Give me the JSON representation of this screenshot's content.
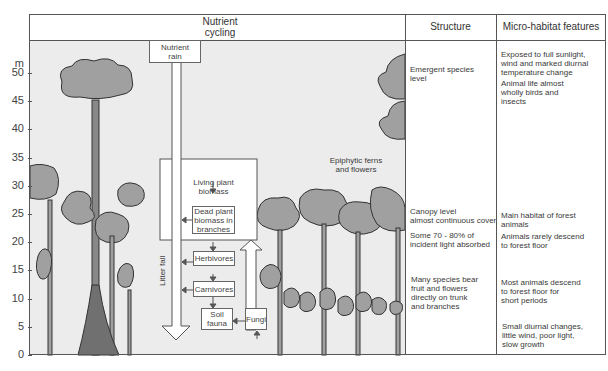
{
  "header": {
    "nutrient_cycling": "Nutrient\ncycling",
    "nutrient_cycling_line1": "Nutrient",
    "nutrient_cycling_line2": "cycling",
    "structure": "Structure",
    "micro_habitat": "Micro-habitat features"
  },
  "y_axis": {
    "unit": "m",
    "ticks": [
      "50",
      "45",
      "40",
      "35",
      "30",
      "25",
      "20",
      "15",
      "10",
      "5",
      "0"
    ]
  },
  "nutrient_cycle": {
    "nutrient_rain": [
      "Nutrient",
      "rain"
    ],
    "living_plant_biomass": [
      "Living plant",
      "biomass"
    ],
    "dead_plant_biomass": [
      "Dead plant",
      "biomass in",
      "branches"
    ],
    "herbivores": "Herbivores",
    "carnivores": "Carnivores",
    "soil_fauna": [
      "Soil",
      "fauna"
    ],
    "fungi": "Fungi",
    "litter_fall": "Litter fall"
  },
  "annotations": {
    "epiphytes": [
      "Epiphytic ferns",
      "and flowers"
    ]
  },
  "structure": {
    "emergent": [
      "Emergent species",
      "level"
    ],
    "canopy": [
      "Canopy level",
      "almost continuous cover"
    ],
    "light": [
      "Some 70 - 80% of",
      "incident light absorbed"
    ],
    "understory": [
      "Many species bear",
      "fruit and flowers",
      "directly on trunk",
      "and branches"
    ]
  },
  "micro_habitat": {
    "emergent_1": [
      "Exposed to full sunlight,",
      "wind and marked diurnal",
      "temperature change"
    ],
    "emergent_2": [
      "Animal life almost",
      "wholly birds and",
      "insects"
    ],
    "canopy_1": [
      "Main habitat of forest",
      "animals"
    ],
    "canopy_2": [
      "Animals rarely descend",
      "to forest floor"
    ],
    "understory_1": [
      "Most animals descend",
      "to forest floor for",
      "short periods"
    ],
    "floor": [
      "Small diurnal changes,",
      "little wind, poor light,",
      "slow growth"
    ]
  },
  "colors": {
    "tree_fill": "#a0a0a0",
    "tree_outline": "#333333",
    "background": "#ececec",
    "frame": "#555555"
  }
}
